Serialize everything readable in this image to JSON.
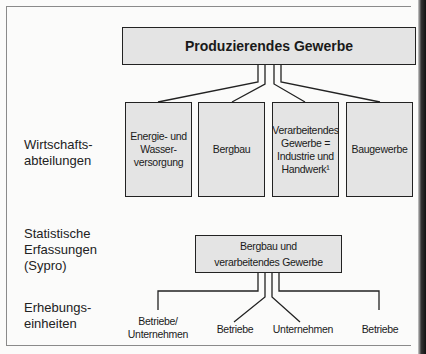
{
  "diagram": {
    "top_box": "Produzierendes Gewerbe",
    "row_labels": {
      "wirtschaft_1": "Wirtschafts-",
      "wirtschaft_2": "abteilungen",
      "stat_1": "Statistische",
      "stat_2": "Erfassungen",
      "stat_3": "(Sypro)",
      "erheb_1": "Erhebungs-",
      "erheb_2": "einheiten"
    },
    "divisions": [
      {
        "lines": [
          "Energie- und",
          "Wasser-",
          "versorgung"
        ]
      },
      {
        "lines": [
          "Bergbau"
        ]
      },
      {
        "lines": [
          "Verarbeitendes",
          "Gewerbe =",
          "Industrie und",
          "Handwerk¹"
        ]
      },
      {
        "lines": [
          "Baugewerbe"
        ]
      }
    ],
    "stat_box": {
      "line1": "Bergbau und",
      "line2": "verarbeitendes Gewerbe"
    },
    "units": [
      {
        "line1": "Betriebe/",
        "line2": "Unternehmen"
      },
      {
        "line1": "Betriebe"
      },
      {
        "line1": "Unternehmen"
      },
      {
        "line1": "Betriebe"
      }
    ],
    "colors": {
      "box_fill": "#e4e4e4",
      "line": "#222222",
      "background": "#fbfbfa"
    }
  }
}
